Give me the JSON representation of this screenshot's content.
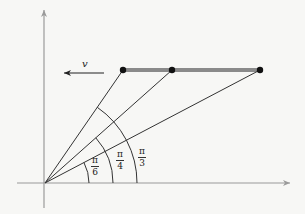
{
  "diagram": {
    "velocity_label": "v",
    "angles": [
      {
        "name": "pi-over-6",
        "numerator": "π",
        "denominator": "6",
        "radians": 0.5236
      },
      {
        "name": "pi-over-4",
        "numerator": "π",
        "denominator": "4",
        "radians": 0.7854
      },
      {
        "name": "pi-over-3",
        "numerator": "π",
        "denominator": "3",
        "radians": 1.0472
      }
    ],
    "colors": {
      "axis": "#9a9a9a",
      "line": "#333333",
      "rod": "#8a8a8a",
      "point": "#111111",
      "background": "#f7f7f5"
    }
  }
}
